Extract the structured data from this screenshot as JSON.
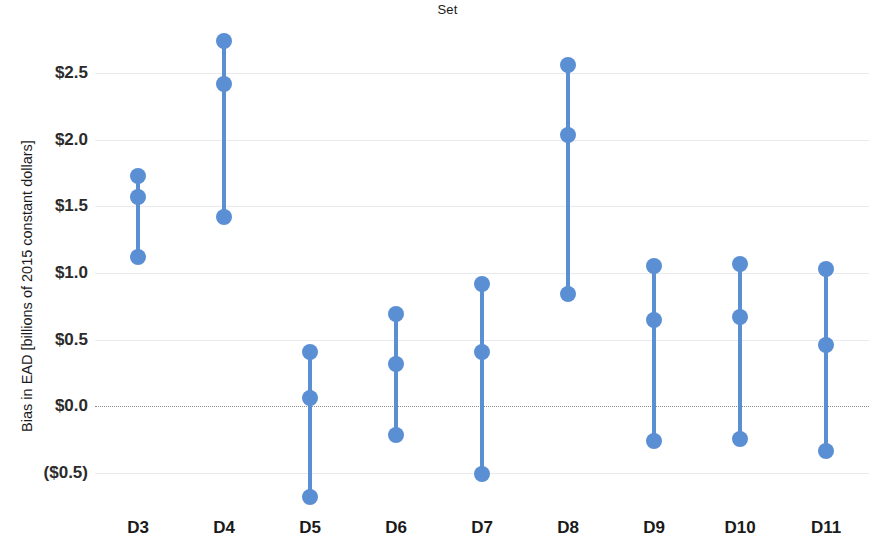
{
  "chart_data": {
    "type": "scatter",
    "title": "Set",
    "xlabel": "",
    "ylabel": "Bias in EAD [billions of 2015 constant dollars]",
    "categories": [
      "D3",
      "D4",
      "D5",
      "D6",
      "D7",
      "D8",
      "D9",
      "D10",
      "D11"
    ],
    "ytick_labels": [
      "$2.5",
      "$2.0",
      "$1.5",
      "$1.0",
      "$0.5",
      "$0.0",
      "($0.5)"
    ],
    "ytick_values": [
      2.5,
      2.0,
      1.5,
      1.0,
      0.5,
      0.0,
      -0.5
    ],
    "ylim": [
      -0.78,
      2.9
    ],
    "grid": true,
    "zero_reference_line": 0.0,
    "legend": null,
    "marker_color": "#5b8fd4",
    "line_color": "#5b8fd4",
    "gridline_color": "#e9e9ee",
    "zeroline_color": "#8a8a8a",
    "series": [
      {
        "name": "upper",
        "values": [
          1.73,
          2.74,
          0.41,
          0.69,
          0.92,
          2.56,
          1.05,
          1.07,
          1.03
        ]
      },
      {
        "name": "central",
        "values": [
          1.57,
          2.42,
          0.06,
          0.32,
          0.41,
          2.04,
          0.65,
          0.67,
          0.46
        ]
      },
      {
        "name": "lower",
        "values": [
          1.12,
          1.42,
          -0.68,
          -0.22,
          -0.51,
          0.84,
          -0.26,
          -0.25,
          -0.34
        ]
      }
    ]
  }
}
